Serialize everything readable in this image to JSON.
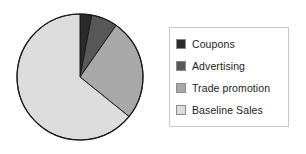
{
  "chart_data": {
    "type": "pie",
    "title": "",
    "categories": [
      "Coupons",
      "Advertising",
      "Trade promotion",
      "Baseline Sales"
    ],
    "values": [
      3,
      6.7,
      26.1,
      64.2
    ],
    "unit": "percent",
    "start_angle_deg": 0,
    "direction": "clockwise",
    "slice_angles_deg": [
      10.8,
      24.1,
      94.1,
      231.0
    ],
    "colors": [
      "#2b2b2b",
      "#585858",
      "#a8a8a8",
      "#dcdcdc"
    ],
    "edge_color": "#1a1a1a",
    "legend_position": "right",
    "grid": false,
    "xlabel": "",
    "ylabel": "",
    "slices": [
      {
        "label": "Coupons",
        "value": 3,
        "color": "#2b2b2b",
        "angle_deg": 10.8
      },
      {
        "label": "Advertising",
        "value": 6.7,
        "color": "#585858",
        "angle_deg": 24.1
      },
      {
        "label": "Trade promotion",
        "value": 26.1,
        "color": "#a8a8a8",
        "angle_deg": 94.1
      },
      {
        "label": "Baseline Sales",
        "value": 64.2,
        "color": "#dcdcdc",
        "angle_deg": 231.0
      }
    ]
  },
  "legend": {
    "items": [
      {
        "label": "Coupons",
        "swatch": "#2b2b2b"
      },
      {
        "label": "Advertising",
        "swatch": "#585858"
      },
      {
        "label": "Trade promotion",
        "swatch": "#a8a8a8"
      },
      {
        "label": "Baseline Sales",
        "swatch": "#dcdcdc"
      }
    ]
  },
  "geometry": {
    "center_x": 80,
    "center_y": 77,
    "radius": 63
  }
}
